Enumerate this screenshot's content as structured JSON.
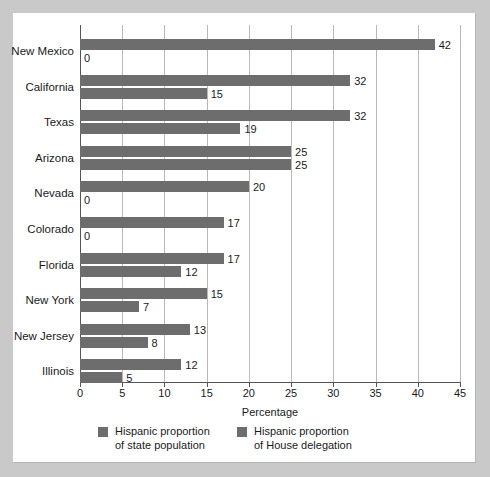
{
  "chart_data": {
    "type": "bar",
    "orientation": "horizontal",
    "title": "",
    "xlabel": "Percentage",
    "ylabel": "",
    "xlim": [
      0,
      45
    ],
    "xticks": [
      0,
      5,
      10,
      15,
      20,
      25,
      30,
      35,
      40,
      45
    ],
    "grid": "vertical",
    "legend_position": "bottom",
    "categories": [
      "New Mexico",
      "California",
      "Texas",
      "Arizona",
      "Nevada",
      "Colorado",
      "Florida",
      "New York",
      "New Jersey",
      "Illinois"
    ],
    "series": [
      {
        "name": "Hispanic proportion of state population",
        "color": "#6d6d6d",
        "values": [
          42,
          32,
          32,
          25,
          20,
          17,
          17,
          15,
          13,
          12
        ]
      },
      {
        "name": "Hispanic proportion of House delegation",
        "color": "#6d6d6d",
        "values": [
          0,
          15,
          19,
          25,
          0,
          0,
          12,
          7,
          8,
          5
        ]
      }
    ]
  },
  "axis": {
    "x_title": "Percentage",
    "tick_labels": [
      "0",
      "5",
      "10",
      "15",
      "20",
      "25",
      "30",
      "35",
      "40",
      "45"
    ]
  },
  "legend": {
    "items": [
      {
        "line1": "Hispanic proportion",
        "line2": "of state population"
      },
      {
        "line1": "Hispanic proportion",
        "line2": "of House delegation"
      }
    ]
  },
  "colors": {
    "bar": "#6d6d6d",
    "page_background": "#c9c9c9",
    "panel_background": "#ffffff",
    "gridline": "#b9b9b9",
    "axis": "#555555",
    "text": "#1a1a1a"
  }
}
